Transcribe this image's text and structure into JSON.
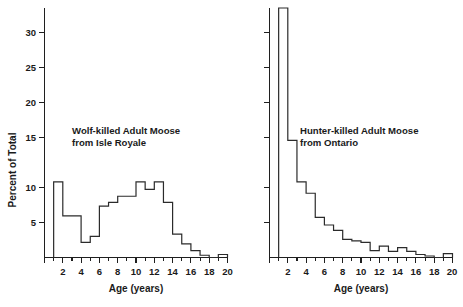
{
  "figure": {
    "background": "#ffffff",
    "ink_color": "#1f1f1f",
    "width": 463,
    "height": 307
  },
  "chart_data": [
    {
      "type": "bar",
      "id": "wolf-killed-isle-royale",
      "title": "",
      "annotation_line1": "Wolf-killed Adult Moose",
      "annotation_line2": "from Isle Royale",
      "xlabel": "Age (years)",
      "ylabel": "Percent of Total",
      "xlim": [
        0,
        20
      ],
      "ylim": [
        0,
        33
      ],
      "xticks": [
        0,
        1,
        2,
        3,
        4,
        5,
        6,
        7,
        8,
        9,
        10,
        11,
        12,
        13,
        14,
        15,
        16,
        17,
        18,
        19,
        20
      ],
      "xticklabels": [
        "",
        "",
        "2",
        "",
        "4",
        "",
        "6",
        "",
        "8",
        "",
        "10",
        "",
        "12",
        "",
        "14",
        "",
        "16",
        "",
        "18",
        "",
        "20"
      ],
      "yticks": [
        5,
        10,
        15,
        20,
        25,
        30
      ],
      "yticklabels": [
        "5",
        "10",
        "15",
        "20",
        "25",
        "30"
      ],
      "grid": false,
      "legend": "none",
      "bin_edges": [
        1,
        2,
        3,
        4,
        5,
        6,
        7,
        8,
        9,
        10,
        11,
        12,
        13,
        14,
        15,
        16,
        17,
        18,
        19,
        20
      ],
      "categories": [
        "1-2",
        "2-3",
        "3-4",
        "4-5",
        "5-6",
        "6-7",
        "7-8",
        "8-9",
        "9-10",
        "10-11",
        "11-12",
        "12-13",
        "13-14",
        "14-15",
        "15-16",
        "16-17",
        "17-18",
        "18-19",
        "19-20"
      ],
      "values": [
        10.0,
        5.5,
        5.5,
        2.0,
        2.8,
        6.8,
        7.3,
        8.1,
        8.1,
        10.0,
        9.0,
        10.0,
        7.3,
        3.1,
        1.8,
        0.9,
        0.3,
        0.0,
        0.4
      ]
    },
    {
      "type": "bar",
      "id": "hunter-killed-ontario",
      "title": "",
      "annotation_line1": "Hunter-killed Adult Moose",
      "annotation_line2": "from Ontario",
      "xlabel": "Age (years)",
      "ylabel": "",
      "xlim": [
        0,
        20
      ],
      "ylim": [
        0,
        33
      ],
      "xticks": [
        0,
        1,
        2,
        3,
        4,
        5,
        6,
        7,
        8,
        9,
        10,
        11,
        12,
        13,
        14,
        15,
        16,
        17,
        18,
        19,
        20
      ],
      "xticklabels": [
        "",
        "",
        "2",
        "",
        "4",
        "",
        "6",
        "",
        "8",
        "",
        "10",
        "",
        "12",
        "",
        "14",
        "",
        "16",
        "",
        "18",
        "",
        "20"
      ],
      "yticks": [
        5,
        10,
        15,
        20,
        25,
        30
      ],
      "yticklabels": [
        "",
        "",
        "",
        "",
        "",
        ""
      ],
      "grid": false,
      "legend": "none",
      "bin_edges": [
        1,
        2,
        3,
        4,
        5,
        6,
        7,
        8,
        9,
        10,
        11,
        12,
        13,
        14,
        15,
        16,
        17,
        18,
        19,
        20
      ],
      "categories": [
        "1-2",
        "2-3",
        "3-4",
        "4-5",
        "5-6",
        "6-7",
        "7-8",
        "8-9",
        "9-10",
        "10-11",
        "11-12",
        "12-13",
        "13-14",
        "14-15",
        "15-16",
        "16-17",
        "17-18",
        "18-19",
        "19-20"
      ],
      "values": [
        33.5,
        15.5,
        10.0,
        8.5,
        5.3,
        4.3,
        3.6,
        2.4,
        2.2,
        2.0,
        0.9,
        1.5,
        0.8,
        1.3,
        0.8,
        0.4,
        0.2,
        0.0,
        0.5
      ],
      "note": "First bar is clipped by the top of the plot frame"
    }
  ]
}
